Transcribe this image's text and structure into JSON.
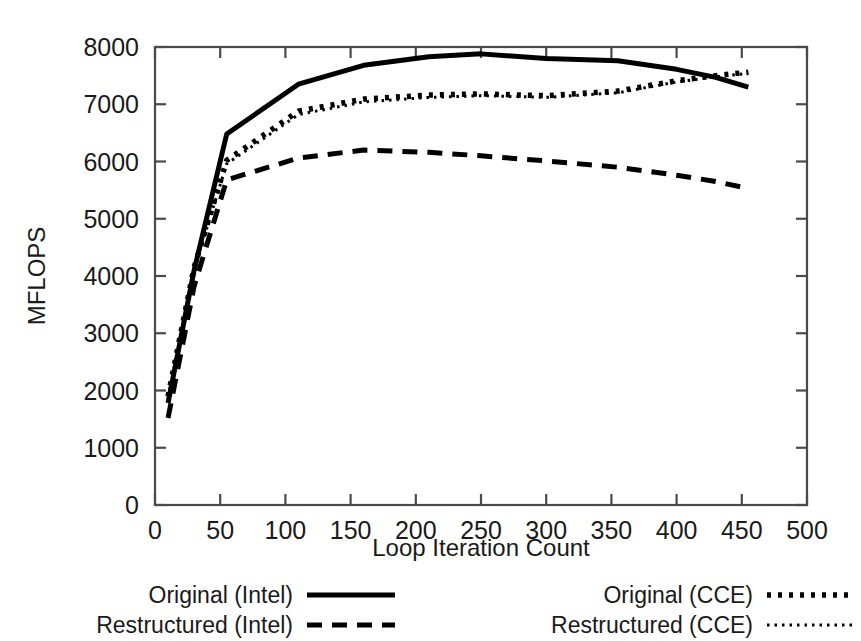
{
  "chart_data": {
    "type": "line",
    "title": "",
    "xlabel": "Loop Iteration Count",
    "ylabel": "MFLOPS",
    "xlim": [
      0,
      500
    ],
    "ylim": [
      0,
      8000
    ],
    "xticks": [
      0,
      50,
      100,
      150,
      200,
      250,
      300,
      350,
      400,
      450,
      500
    ],
    "xtick_labels": [
      "0",
      "50",
      "100",
      "150",
      "200",
      "250",
      "300",
      "350",
      "400",
      "450",
      "500"
    ],
    "yticks": [
      0,
      1000,
      2000,
      3000,
      4000,
      5000,
      6000,
      7000,
      8000
    ],
    "ytick_labels": [
      "0",
      "1000",
      "2000",
      "3000",
      "4000",
      "5000",
      "6000",
      "7000",
      "8000"
    ],
    "grid": false,
    "legend_position": "below-axes",
    "series": [
      {
        "name": "Original (Intel)",
        "style": "solid",
        "x": [
          10,
          30,
          55,
          110,
          160,
          210,
          250,
          300,
          355,
          400,
          430,
          455
        ],
        "y": [
          1780,
          4100,
          6480,
          7350,
          7680,
          7830,
          7880,
          7800,
          7760,
          7610,
          7470,
          7300
        ]
      },
      {
        "name": "Restructured (Intel)",
        "style": "dashed",
        "x": [
          10,
          30,
          55,
          110,
          160,
          210,
          250,
          300,
          355,
          400,
          430,
          455
        ],
        "y": [
          1520,
          3820,
          5680,
          6060,
          6200,
          6160,
          6100,
          6010,
          5900,
          5760,
          5650,
          5530
        ]
      },
      {
        "name": "Original (CCE)",
        "style": "dotted",
        "x": [
          10,
          30,
          55,
          110,
          160,
          210,
          250,
          300,
          355,
          400,
          430,
          455
        ],
        "y": [
          1900,
          4150,
          6020,
          6880,
          7090,
          7160,
          7180,
          7150,
          7230,
          7410,
          7500,
          7560
        ]
      },
      {
        "name": "Restructured (CCE)",
        "style": "fine-dotted",
        "x": [
          10,
          30,
          55,
          110,
          160,
          210,
          250,
          300,
          355,
          400,
          430,
          455
        ],
        "y": [
          1880,
          4120,
          5960,
          6820,
          7040,
          7120,
          7150,
          7120,
          7200,
          7390,
          7480,
          7540
        ]
      }
    ]
  },
  "legend": {
    "entries": [
      {
        "label": "Original (Intel)",
        "style": "solid"
      },
      {
        "label": "Restructured (Intel)",
        "style": "dashed"
      },
      {
        "label": "Original (CCE)",
        "style": "dotted"
      },
      {
        "label": "Restructured (CCE)",
        "style": "fine-dotted"
      }
    ]
  }
}
